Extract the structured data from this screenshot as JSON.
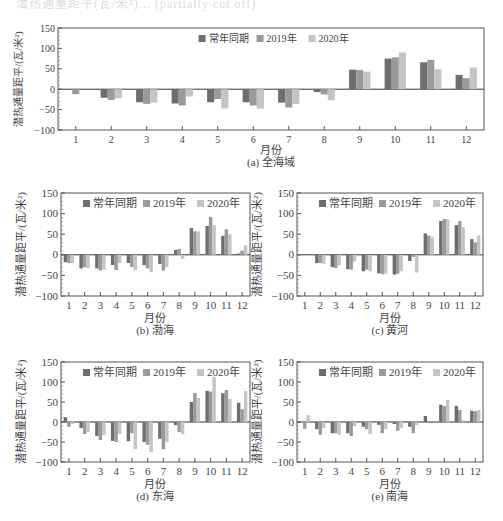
{
  "page": {
    "top_fragment": "潜热通量距平(瓦/米²)... (partially cut off)"
  },
  "legend": {
    "items": [
      {
        "label": "常年同期",
        "color": "#6e6e6e"
      },
      {
        "label": "2019年",
        "color": "#9a9a9a"
      },
      {
        "label": "2020年",
        "color": "#c4c4c4"
      }
    ]
  },
  "axis": {
    "ylabel": "潜热通量距平/(瓦/米²)",
    "xlabel": "月份",
    "yticks": [
      150,
      100,
      50,
      0,
      -50,
      -100
    ],
    "ylim": [
      -100,
      150
    ],
    "months": [
      "1",
      "2",
      "3",
      "4",
      "5",
      "6",
      "7",
      "8",
      "9",
      "10",
      "11",
      "12"
    ]
  },
  "chart_data": [
    {
      "id": "a",
      "type": "bar",
      "title": "(a) 全海域",
      "xlabel": "月份",
      "ylabel": "潜热通量距平/(瓦/米²)",
      "ylim": [
        -100,
        150
      ],
      "categories": [
        "1",
        "2",
        "3",
        "4",
        "5",
        "6",
        "7",
        "8",
        "9",
        "10",
        "11",
        "12"
      ],
      "series": [
        {
          "name": "常年同期",
          "values": [
            0,
            -21,
            -32,
            -35,
            -32,
            -32,
            -33,
            -7,
            48,
            75,
            66,
            35
          ]
        },
        {
          "name": "2019年",
          "values": [
            -12,
            -26,
            -36,
            -40,
            -24,
            -40,
            -45,
            -13,
            47,
            78,
            72,
            27
          ]
        },
        {
          "name": "2020年",
          "values": [
            0,
            -22,
            -33,
            -18,
            -47,
            -48,
            -36,
            -27,
            43,
            90,
            49,
            53
          ]
        }
      ]
    },
    {
      "id": "b",
      "type": "bar",
      "title": "(b) 渤海",
      "xlabel": "月份",
      "ylabel": "潜热通量距平/(瓦/米²)",
      "ylim": [
        -100,
        150
      ],
      "categories": [
        "1",
        "2",
        "3",
        "4",
        "5",
        "6",
        "7",
        "8",
        "9",
        "10",
        "11",
        "12"
      ],
      "series": [
        {
          "name": "常年同期",
          "values": [
            -18,
            -33,
            -33,
            -25,
            -20,
            -25,
            -22,
            12,
            65,
            70,
            46,
            3
          ]
        },
        {
          "name": "2019年",
          "values": [
            -20,
            -30,
            -38,
            -37,
            -30,
            -33,
            -38,
            14,
            57,
            92,
            62,
            10
          ]
        },
        {
          "name": "2020年",
          "values": [
            -20,
            -32,
            -36,
            -20,
            -38,
            -42,
            -30,
            -10,
            57,
            72,
            50,
            23
          ]
        }
      ]
    },
    {
      "id": "c",
      "type": "bar",
      "title": "(c) 黄河",
      "xlabel": "月份",
      "ylabel": "潜热通量距平/(瓦/米²)",
      "ylim": [
        -100,
        150
      ],
      "categories": [
        "1",
        "2",
        "3",
        "4",
        "5",
        "6",
        "7",
        "8",
        "9",
        "10",
        "11",
        "12"
      ],
      "series": [
        {
          "name": "常年同期",
          "values": [
            2,
            -20,
            -30,
            -35,
            -40,
            -45,
            -48,
            -15,
            52,
            82,
            72,
            38
          ]
        },
        {
          "name": "2019年",
          "values": [
            0,
            -20,
            -32,
            -36,
            -36,
            -47,
            -46,
            -5,
            47,
            87,
            82,
            30
          ]
        },
        {
          "name": "2020年",
          "values": [
            0,
            -22,
            -26,
            -16,
            -40,
            -46,
            -40,
            -43,
            44,
            86,
            67,
            47
          ]
        }
      ]
    },
    {
      "id": "d",
      "type": "bar",
      "title": "(d) 东海",
      "xlabel": "月份",
      "ylabel": "潜热通量距平/(瓦/米²)",
      "ylim": [
        -100,
        150
      ],
      "categories": [
        "1",
        "2",
        "3",
        "4",
        "5",
        "6",
        "7",
        "8",
        "9",
        "10",
        "11",
        "12"
      ],
      "series": [
        {
          "name": "常年同期",
          "values": [
            12,
            -15,
            -35,
            -47,
            -48,
            -50,
            -42,
            -8,
            50,
            78,
            72,
            48
          ]
        },
        {
          "name": "2019年",
          "values": [
            -12,
            -30,
            -45,
            -50,
            -28,
            -57,
            -68,
            -25,
            72,
            76,
            80,
            32
          ]
        },
        {
          "name": "2020年",
          "values": [
            -5,
            -25,
            -33,
            -30,
            -68,
            -75,
            -50,
            -30,
            60,
            113,
            58,
            77
          ]
        }
      ]
    },
    {
      "id": "e",
      "type": "bar",
      "title": "(e) 南海",
      "xlabel": "月份",
      "ylabel": "潜热通量距平/(瓦/米²)",
      "ylim": [
        -100,
        150
      ],
      "categories": [
        "1",
        "2",
        "3",
        "4",
        "5",
        "6",
        "7",
        "8",
        "9",
        "10",
        "11",
        "12"
      ],
      "series": [
        {
          "name": "常年同期",
          "values": [
            0,
            -18,
            -28,
            -28,
            -12,
            -7,
            -5,
            -12,
            15,
            43,
            40,
            28
          ]
        },
        {
          "name": "2019年",
          "values": [
            -17,
            -32,
            -28,
            -35,
            -18,
            -28,
            -22,
            -28,
            2,
            40,
            30,
            27
          ]
        },
        {
          "name": "2020年",
          "values": [
            17,
            -15,
            -32,
            -10,
            -30,
            -18,
            -15,
            -8,
            0,
            55,
            5,
            30
          ]
        }
      ]
    }
  ],
  "panels": [
    {
      "id": "a",
      "x": 58,
      "y": 28,
      "w": 426,
      "h": 102,
      "caption": "(a) 全海域",
      "capX": 271,
      "capY": 153,
      "xlblY": 141
    },
    {
      "id": "b",
      "x": 61,
      "y": 193,
      "w": 189,
      "h": 103,
      "caption": "(b) 渤海",
      "capX": 155,
      "capY": 321,
      "xlblY": 309
    },
    {
      "id": "c",
      "x": 297,
      "y": 193,
      "w": 186,
      "h": 103,
      "caption": "(c) 黄河",
      "capX": 390,
      "capY": 321,
      "xlblY": 309
    },
    {
      "id": "d",
      "x": 61,
      "y": 362,
      "w": 189,
      "h": 100,
      "caption": "(d) 东海",
      "capX": 155,
      "capY": 487,
      "xlblY": 475
    },
    {
      "id": "e",
      "x": 297,
      "y": 362,
      "w": 186,
      "h": 100,
      "caption": "(e) 南海",
      "capX": 390,
      "capY": 487,
      "xlblY": 475
    }
  ]
}
